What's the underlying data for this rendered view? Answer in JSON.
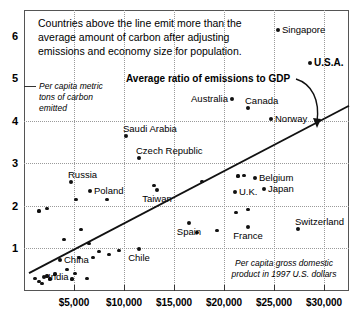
{
  "chart_data": {
    "type": "scatter",
    "title": "",
    "xlabel": "Per capita gross domestic product in 1997 U.S. dollars",
    "ylabel": "Per capita metric tons of carbon emitted",
    "xlim": [
      0,
      32500
    ],
    "ylim": [
      0,
      6.6
    ],
    "grid": true,
    "legend": "none",
    "xticks": [
      "$5,000",
      "$10,000",
      "$15,000",
      "$20,000",
      "$25,000",
      "$30,000"
    ],
    "xtick_values": [
      5000,
      10000,
      15000,
      20000,
      25000,
      30000
    ],
    "yticks": [
      "1",
      "2",
      "3",
      "4",
      "5",
      "6"
    ],
    "ytick_values": [
      1,
      2,
      3,
      4,
      5,
      6
    ],
    "annotations": [
      {
        "name": "caption",
        "text": "Countries above the line emit more than the average amount of carbon after adjusting emissions and economy size for population."
      },
      {
        "name": "trendline-label",
        "text": "Average ratio of emissions to GDP"
      },
      {
        "name": "y-axis-note",
        "text": "Per capita metric tons of carbon emitted"
      },
      {
        "name": "x-axis-note",
        "text": "Per capita gross domestic product in 1997 U.S. dollars"
      }
    ],
    "trendline": {
      "name": "Average ratio of emissions to GDP",
      "x0": 500,
      "y0": 0.42,
      "x1": 32500,
      "y1": 4.35
    },
    "labeled_points": [
      {
        "label": "Singapore",
        "x": 25400,
        "y": 6.12,
        "label_pos": "right"
      },
      {
        "label": "U.S.A.",
        "x": 28600,
        "y": 5.35,
        "label_pos": "right",
        "bold": true
      },
      {
        "label": "Australia",
        "x": 20800,
        "y": 4.5,
        "label_pos": "left"
      },
      {
        "label": "Canada",
        "x": 22400,
        "y": 4.3,
        "label_pos": "above"
      },
      {
        "label": "Norway",
        "x": 24700,
        "y": 4.05,
        "label_pos": "right"
      },
      {
        "label": "Saudi Arabia",
        "x": 10200,
        "y": 3.65,
        "label_pos": "above"
      },
      {
        "label": "Czech Republic",
        "x": 11500,
        "y": 3.12,
        "label_pos": "above"
      },
      {
        "label": "Russia",
        "x": 4700,
        "y": 2.55,
        "label_pos": "above"
      },
      {
        "label": "Poland",
        "x": 6600,
        "y": 2.35,
        "label_pos": "right"
      },
      {
        "label": "Taiwan",
        "x": 13300,
        "y": 2.38,
        "label_pos": "below"
      },
      {
        "label": "Belgium",
        "x": 23100,
        "y": 2.65,
        "label_pos": "right"
      },
      {
        "label": "U.K.",
        "x": 21100,
        "y": 2.32,
        "label_pos": "right"
      },
      {
        "label": "Japan",
        "x": 24000,
        "y": 2.4,
        "label_pos": "right"
      },
      {
        "label": "Switzerland",
        "x": 27400,
        "y": 1.45,
        "label_pos": "above"
      },
      {
        "label": "Spain",
        "x": 16500,
        "y": 1.6,
        "label_pos": "below"
      },
      {
        "label": "France",
        "x": 22400,
        "y": 1.5,
        "label_pos": "below"
      },
      {
        "label": "Chile",
        "x": 11500,
        "y": 0.98,
        "label_pos": "below"
      },
      {
        "label": "China",
        "x": 3600,
        "y": 0.72,
        "label_pos": "right"
      },
      {
        "label": "India",
        "x": 2000,
        "y": 0.32,
        "label_pos": "right"
      }
    ],
    "unlabeled_points": [
      {
        "x": 1100,
        "y": 0.3
      },
      {
        "x": 1500,
        "y": 0.22
      },
      {
        "x": 1800,
        "y": 0.18
      },
      {
        "x": 2300,
        "y": 0.35
      },
      {
        "x": 2600,
        "y": 0.28
      },
      {
        "x": 3100,
        "y": 0.4
      },
      {
        "x": 1500,
        "y": 1.88
      },
      {
        "x": 2300,
        "y": 1.93
      },
      {
        "x": 4000,
        "y": 1.2
      },
      {
        "x": 4300,
        "y": 0.5
      },
      {
        "x": 4800,
        "y": 0.28
      },
      {
        "x": 5100,
        "y": 0.42
      },
      {
        "x": 5500,
        "y": 0.78
      },
      {
        "x": 5200,
        "y": 2.15
      },
      {
        "x": 5700,
        "y": 1.45
      },
      {
        "x": 6300,
        "y": 0.3
      },
      {
        "x": 6500,
        "y": 1.12
      },
      {
        "x": 6900,
        "y": 0.78
      },
      {
        "x": 7500,
        "y": 0.92
      },
      {
        "x": 8300,
        "y": 2.15
      },
      {
        "x": 8500,
        "y": 0.85
      },
      {
        "x": 9500,
        "y": 0.95
      },
      {
        "x": 13000,
        "y": 2.48
      },
      {
        "x": 17800,
        "y": 2.58
      },
      {
        "x": 17300,
        "y": 1.38
      },
      {
        "x": 19300,
        "y": 1.42
      },
      {
        "x": 21400,
        "y": 2.7
      },
      {
        "x": 21200,
        "y": 1.85
      },
      {
        "x": 22400,
        "y": 1.92
      },
      {
        "x": 22000,
        "y": 2.72
      }
    ]
  },
  "axes": {
    "y_note_line1": "Per capita metric",
    "y_note_line2": "tons of carbon",
    "y_note_line3": "emitted",
    "x_note_line1": "Per capita gross domestic",
    "x_note_line2": "product in 1997 U.S. dollars"
  },
  "caption": {
    "line1": "Countries above the line emit more than the",
    "line2": "average amount of carbon after adjusting",
    "line3": "emissions and economy size for population."
  },
  "trendline_label": "Average ratio of emissions to GDP"
}
